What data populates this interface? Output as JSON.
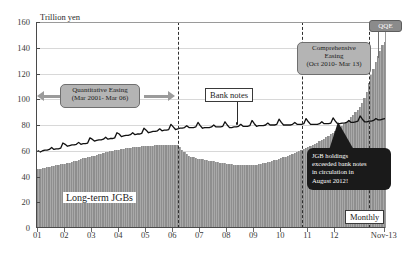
{
  "chart_data": {
    "type": "bar",
    "title": "",
    "subtitle": "",
    "yaxis_title": "Trillion yen",
    "xlabel": "",
    "ylabel": "Trillion yen",
    "ylim": [
      0,
      160
    ],
    "yticks": [
      0,
      20,
      40,
      60,
      80,
      100,
      120,
      140,
      160
    ],
    "grid": true,
    "legend_position": "inline-annotations",
    "xtick_labels": [
      "01",
      "02",
      "03",
      "04",
      "05",
      "06",
      "07",
      "08",
      "09",
      "10",
      "11",
      "12",
      "Nov-13"
    ],
    "x_axis_note": "Monthly observations, Jan 2001 - Nov 2013",
    "series": [
      {
        "name": "Long-term JGBs",
        "type": "bar",
        "color": "#8e8e8e",
        "values": [
          45.0,
          45.3,
          45.6,
          46.0,
          46.4,
          46.8,
          47.1,
          47.5,
          47.9,
          48.2,
          48.6,
          49.0,
          49.3,
          49.6,
          50.0,
          50.5,
          51.0,
          51.6,
          52.2,
          52.8,
          53.3,
          53.8,
          54.2,
          54.6,
          55.0,
          55.4,
          55.9,
          56.4,
          56.9,
          57.4,
          57.9,
          58.3,
          58.7,
          59.1,
          59.5,
          59.9,
          60.2,
          60.5,
          60.8,
          61.1,
          61.4,
          61.7,
          61.9,
          62.1,
          62.3,
          62.5,
          62.7,
          62.9,
          63.0,
          63.1,
          63.2,
          63.3,
          63.4,
          63.5,
          63.5,
          63.5,
          63.4,
          63.4,
          63.5,
          63.6,
          63.7,
          63.6,
          63.4,
          62.0,
          60.0,
          58.0,
          56.5,
          55.4,
          54.6,
          54.0,
          53.5,
          53.1,
          52.8,
          52.5,
          52.2,
          51.9,
          51.6,
          51.3,
          51.0,
          50.7,
          50.4,
          50.1,
          49.8,
          49.5,
          49.2,
          48.9,
          48.7,
          48.5,
          48.3,
          48.1,
          48.0,
          47.9,
          47.9,
          47.9,
          48.0,
          48.1,
          48.3,
          48.5,
          48.8,
          49.1,
          49.4,
          49.8,
          50.2,
          50.7,
          51.2,
          51.7,
          52.2,
          52.8,
          53.4,
          54.0,
          54.6,
          55.2,
          55.9,
          56.6,
          57.3,
          58.0,
          58.8,
          59.6,
          60.4,
          61.2,
          62.0,
          62.9,
          63.8,
          64.7,
          65.6,
          66.6,
          67.6,
          68.6,
          69.7,
          70.8,
          72.0,
          73.2,
          74.5,
          75.8,
          77.2,
          78.6,
          80.1,
          81.7,
          83.4,
          85.2,
          87.1,
          89.1,
          91.2,
          93.5,
          96.0,
          100.0,
          105.0,
          112.0,
          118.0,
          123.0,
          128.0,
          133.0,
          137.0,
          141.0,
          144.0
        ]
      },
      {
        "name": "Bank notes",
        "type": "line",
        "color": "#111111",
        "values": [
          60.0,
          59.0,
          60.0,
          60.5,
          60.5,
          61.0,
          62.5,
          61.0,
          61.5,
          61.5,
          62.0,
          66.0,
          65.0,
          63.5,
          64.0,
          64.5,
          64.5,
          65.0,
          66.5,
          65.0,
          65.5,
          65.5,
          66.0,
          70.0,
          69.0,
          67.5,
          68.0,
          68.5,
          68.5,
          69.0,
          70.5,
          69.0,
          69.5,
          69.5,
          70.0,
          74.0,
          73.0,
          71.0,
          71.5,
          72.0,
          72.0,
          72.5,
          74.0,
          72.5,
          73.0,
          73.0,
          73.5,
          77.5,
          76.0,
          74.0,
          74.5,
          75.0,
          75.0,
          75.5,
          77.0,
          75.5,
          76.0,
          76.0,
          76.5,
          80.5,
          78.5,
          76.5,
          77.0,
          77.5,
          77.5,
          78.0,
          79.5,
          78.0,
          78.0,
          78.0,
          78.5,
          82.0,
          79.5,
          77.5,
          78.0,
          78.0,
          78.0,
          78.5,
          80.0,
          78.5,
          78.5,
          78.5,
          79.0,
          82.5,
          80.0,
          78.0,
          78.0,
          78.5,
          78.5,
          79.0,
          80.5,
          79.0,
          79.0,
          79.0,
          79.5,
          83.5,
          81.0,
          79.0,
          79.5,
          79.5,
          79.5,
          80.0,
          81.5,
          80.0,
          80.0,
          80.0,
          80.5,
          84.5,
          82.0,
          80.0,
          80.0,
          80.0,
          80.0,
          80.5,
          82.0,
          80.5,
          80.5,
          80.5,
          81.0,
          85.0,
          82.5,
          80.5,
          80.5,
          80.5,
          80.5,
          81.0,
          82.5,
          81.0,
          81.0,
          81.0,
          81.5,
          85.5,
          83.0,
          81.0,
          81.0,
          81.5,
          81.5,
          82.0,
          83.5,
          82.0,
          82.0,
          82.5,
          83.0,
          87.0,
          84.5,
          82.5,
          82.5,
          83.0,
          83.0,
          83.5,
          85.0,
          84.0,
          84.0,
          84.5,
          85.0
        ]
      }
    ],
    "annotations": [
      {
        "id": "quantitative-easing",
        "line1": "Quantitative Easing",
        "line2": "(Mar 2001- Mar 06)",
        "style": "gray-rounded"
      },
      {
        "id": "comprehensive-easing",
        "line1": "Comprehensive",
        "line2": "Easing",
        "line3": "(Oct 2010- Mar 13)",
        "style": "gray-rounded"
      },
      {
        "id": "qqe",
        "text": "QQE",
        "style": "gray-badge"
      },
      {
        "id": "jgb-exceeded",
        "line1": "JGB holdings",
        "line2": "exceeded bank notes",
        "line3": "in circulation in",
        "line4": "August 2012!",
        "style": "black-callout"
      },
      {
        "id": "bank-notes-label",
        "text": "Bank notes",
        "style": "boxed-label"
      },
      {
        "id": "long-term-jgbs-label",
        "text": "Long-term JGBs",
        "style": "inline-white-label"
      },
      {
        "id": "monthly-badge",
        "text": "Monthly",
        "style": "boxed-label"
      }
    ],
    "event_lines": [
      {
        "id": "mar-2006",
        "label": "Mar 06",
        "x_index": 62
      },
      {
        "id": "oct-2010",
        "label": "Oct 2010",
        "x_index": 117
      },
      {
        "id": "apr-2013",
        "label": "Apr 2013",
        "x_index": 147
      }
    ],
    "colors": {
      "bar": "#8e8e8e",
      "line": "#111111",
      "callout_gray": "#b4b4b4",
      "callout_dark": "#1a1a1a",
      "grid": "#d8d8d8",
      "axis": "#4a4a4a",
      "background": "#ffffff"
    }
  }
}
